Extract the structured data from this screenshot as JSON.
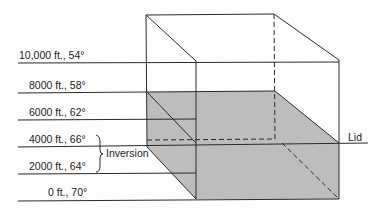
{
  "diagram": {
    "colors": {
      "line": "#2a2a2a",
      "shade": "#bdbdbd",
      "background": "#fdfdfd"
    },
    "altitude_levels": [
      {
        "label": "10,000 ft., 54°"
      },
      {
        "label": "8000 ft., 58°"
      },
      {
        "label": "6000 ft., 62°"
      },
      {
        "label": "4000 ft., 66°"
      },
      {
        "label": "2000 ft., 64°"
      },
      {
        "label": "0 ft., 70°"
      }
    ],
    "inversion_label": "Inversion",
    "lid_label": "Lid"
  }
}
